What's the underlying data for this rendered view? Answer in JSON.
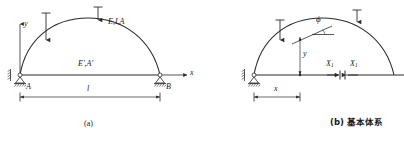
{
  "figure": {
    "title_a": "(a)",
    "title_b": "(b) 基本体系",
    "stroke_color": "#2b2b2b",
    "fill_color": "#ffffff"
  },
  "panel_a": {
    "name": "tied-arch-original-structure",
    "axis_y_label": "y",
    "axis_x_label": "x",
    "arch_label": "E,I,A",
    "tie_label": "E',A'",
    "support_left_label": "A",
    "support_right_label": "B",
    "span_label": "l",
    "loads": [
      {
        "name": "point-load-left",
        "label": ""
      },
      {
        "name": "point-load-crown",
        "label": ""
      }
    ],
    "caption": "(a)"
  },
  "panel_b": {
    "name": "primary-basic-system",
    "angle_label": "ϕ",
    "rise_label": "y",
    "abscissa_label": "x",
    "redundant_left_label": "X",
    "redundant_left_sub": "1",
    "redundant_right_label": "X",
    "redundant_right_sub": "1",
    "caption": "(b) 基本体系"
  }
}
